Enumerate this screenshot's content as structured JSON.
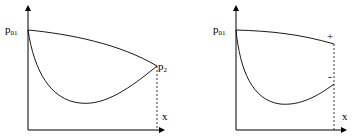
{
  "diagrams": [
    {
      "id": "left",
      "y_label": {
        "base": "p",
        "sub": "01"
      },
      "x_label": "x",
      "end_label": {
        "base": "p",
        "sub": "2"
      },
      "curves": [
        "upper-curve",
        "lower-curve"
      ],
      "description": "Two curves starting at p01 and converging at p2 at the right boundary"
    },
    {
      "id": "right",
      "y_label": {
        "base": "p",
        "sub": "01"
      },
      "x_label": "x",
      "upper_end_label": "+",
      "lower_end_label": "-",
      "curves": [
        "upper-curve",
        "lower-curve"
      ],
      "description": "Two curves starting at p01 ending at different values marked + and - at the right boundary"
    }
  ]
}
